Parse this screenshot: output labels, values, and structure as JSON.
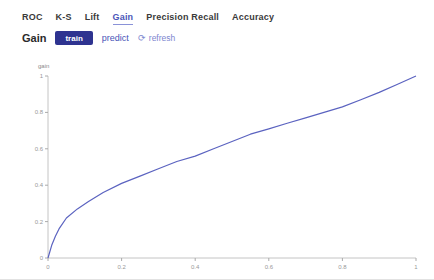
{
  "colors": {
    "accent": "#4a55b8",
    "active_tab_underline": "#8a92d8",
    "train_button_bg": "#2e3390",
    "curve": "#5b63c0",
    "axis_line": "#c4c4c4",
    "tick_text": "#999999"
  },
  "tabs": {
    "items": [
      {
        "label": "ROC",
        "active": false
      },
      {
        "label": "K-S",
        "active": false
      },
      {
        "label": "Lift",
        "active": false
      },
      {
        "label": "Gain",
        "active": true
      },
      {
        "label": "Precision Recall",
        "active": false
      },
      {
        "label": "Accuracy",
        "active": false
      }
    ]
  },
  "header": {
    "title": "Gain",
    "train_button": "train",
    "predict_link": "predict",
    "refresh_icon": "⟳",
    "refresh_label": "refresh"
  },
  "chart_data": {
    "type": "line",
    "title": "Gain",
    "xlabel": "",
    "ylabel": "gain",
    "xlim": [
      0,
      1
    ],
    "ylim": [
      0,
      1
    ],
    "xticks": [
      0,
      0.2,
      0.4,
      0.6,
      0.8,
      1
    ],
    "yticks": [
      0,
      0.2,
      0.4,
      0.6,
      0.8,
      1
    ],
    "grid": false,
    "legend": "none",
    "series": [
      {
        "name": "train gain",
        "color": "#5b63c0",
        "x": [
          0,
          0.01,
          0.02,
          0.03,
          0.05,
          0.08,
          0.11,
          0.15,
          0.2,
          0.25,
          0.3,
          0.35,
          0.4,
          0.45,
          0.5,
          0.55,
          0.6,
          0.65,
          0.7,
          0.75,
          0.8,
          0.85,
          0.9,
          0.95,
          1.0
        ],
        "y": [
          0,
          0.07,
          0.12,
          0.16,
          0.22,
          0.27,
          0.31,
          0.36,
          0.41,
          0.45,
          0.49,
          0.53,
          0.56,
          0.6,
          0.64,
          0.68,
          0.71,
          0.74,
          0.77,
          0.8,
          0.83,
          0.87,
          0.91,
          0.955,
          1.0
        ]
      }
    ]
  }
}
